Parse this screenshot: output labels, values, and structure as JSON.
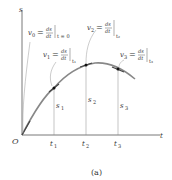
{
  "figure": {
    "caption": "(a)",
    "axes": {
      "vertical_label": "s",
      "horizontal_label": "t",
      "origin_label": "O"
    },
    "time_labels": [
      {
        "base": "t",
        "sub": "1"
      },
      {
        "base": "t",
        "sub": "2"
      },
      {
        "base": "t",
        "sub": "3"
      }
    ],
    "position_labels": [
      {
        "base": "s",
        "sub": "1"
      },
      {
        "base": "s",
        "sub": "2"
      },
      {
        "base": "s",
        "sub": "3"
      }
    ],
    "velocity_annotations": [
      {
        "lhs": "v",
        "sub": "0",
        "eq": "=",
        "num": "ds",
        "den": "dt",
        "eval": "t = 0"
      },
      {
        "lhs": "v",
        "sub": "1",
        "eq": "=",
        "num": "ds",
        "den": "dt",
        "eval": "t₁"
      },
      {
        "lhs": "v",
        "sub": "2",
        "eq": "=",
        "num": "ds",
        "den": "dt",
        "eval": "t₂"
      },
      {
        "lhs": "v",
        "sub": "3",
        "eq": "=",
        "num": "ds",
        "den": "dt",
        "eval": "t₃"
      }
    ],
    "colors": {
      "curve": "#777777",
      "axis": "#555555",
      "tangent": "#333333",
      "point": "#111111"
    }
  }
}
